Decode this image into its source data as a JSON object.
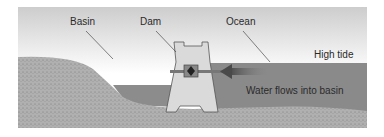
{
  "diagram": {
    "labels": {
      "basin": "Basin",
      "dam": "Dam",
      "ocean": "Ocean",
      "high_tide": "High tide",
      "flow": "Water flows into basin"
    },
    "colors": {
      "sky_top": "#cfcfcf",
      "sky_bottom": "#ffffff",
      "water": "#8a8a8a",
      "ground": "#a9a9a9",
      "dam": "#d9d9d9",
      "arrow": "#555555"
    }
  }
}
